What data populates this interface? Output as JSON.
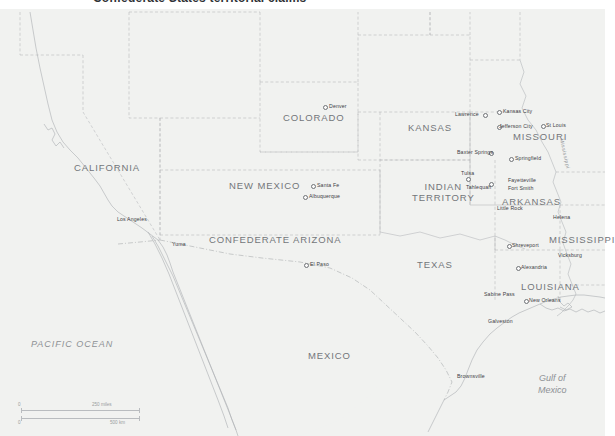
{
  "page": {
    "title_fragment": "Confederate States territorial claims",
    "background_color": "#ffffff",
    "land_color": "#f1f2f0",
    "water_color": "#fcfcfc",
    "border_color": "#b5b8bb",
    "label_color": "#73767a",
    "city_label_color": "#3d4044"
  },
  "water_labels": [
    {
      "name": "pacific-ocean",
      "text": "PACIFIC OCEAN"
    },
    {
      "name": "gulf-of-mexico",
      "line1": "Gulf of",
      "line2": "Mexico"
    }
  ],
  "river_labels": [
    {
      "name": "mississippi-river",
      "text": "Mississippi"
    }
  ],
  "regions": [
    {
      "name": "california",
      "label": "CALIFORNIA"
    },
    {
      "name": "colorado",
      "label": "COLORADO"
    },
    {
      "name": "kansas",
      "label": "KANSAS"
    },
    {
      "name": "missouri",
      "label": "MISSOURI"
    },
    {
      "name": "new-mexico",
      "label": "NEW MEXICO"
    },
    {
      "name": "confederate-arizona",
      "label": "CONFEDERATE ARIZONA"
    },
    {
      "name": "indian-territory",
      "label_line1": "INDIAN",
      "label_line2": "TERRITORY"
    },
    {
      "name": "arkansas",
      "label": "ARKANSAS"
    },
    {
      "name": "mississippi",
      "label": "MISSISSIPPI"
    },
    {
      "name": "louisiana",
      "label": "LOUISIANA"
    },
    {
      "name": "texas",
      "label": "TEXAS"
    },
    {
      "name": "mexico",
      "label": "MEXICO"
    }
  ],
  "cities": [
    {
      "name": "denver",
      "label": "Denver",
      "dot": true
    },
    {
      "name": "lawrence",
      "label": "Lawrence",
      "dot": true
    },
    {
      "name": "kansas-city",
      "label": "Kansas City",
      "dot": true
    },
    {
      "name": "jefferson-city",
      "label": "Jefferson City",
      "dot": true
    },
    {
      "name": "st-louis",
      "label": "St Louis",
      "dot": true
    },
    {
      "name": "baxter-springs",
      "label": "Baxter Springs",
      "dot": true
    },
    {
      "name": "springfield",
      "label": "Springfield",
      "dot": true
    },
    {
      "name": "tulsa",
      "label": "Tulsa",
      "dot": true
    },
    {
      "name": "tahlequah",
      "label": "Tahlequah",
      "dot": true
    },
    {
      "name": "fayetteville",
      "label": "Fayetteville",
      "dot": false
    },
    {
      "name": "fort-smith",
      "label": "Fort Smith",
      "dot": false
    },
    {
      "name": "little-rock",
      "label": "Little Rock",
      "dot": false
    },
    {
      "name": "helena",
      "label": "Helena",
      "dot": false
    },
    {
      "name": "vicksburg",
      "label": "Vicksburg",
      "dot": false
    },
    {
      "name": "shreveport",
      "label": "Shreveport",
      "dot": true
    },
    {
      "name": "alexandria",
      "label": "Alexandria",
      "dot": true
    },
    {
      "name": "new-orleans",
      "label": "New Orleans",
      "dot": true
    },
    {
      "name": "sabine-pass",
      "label": "Sabine Pass",
      "dot": false
    },
    {
      "name": "galveston",
      "label": "Galveston",
      "dot": false
    },
    {
      "name": "brownsville",
      "label": "Brownsville",
      "dot": false
    },
    {
      "name": "el-paso",
      "label": "El Paso",
      "dot": true
    },
    {
      "name": "yuma",
      "label": "Yuma",
      "dot": false
    },
    {
      "name": "los-angeles",
      "label": "Los Angeles",
      "dot": false
    },
    {
      "name": "santa-fe",
      "label": "Santa Fe",
      "dot": true
    },
    {
      "name": "albuquerque",
      "label": "Albuquerque",
      "dot": true
    }
  ],
  "scale_bar": {
    "name": "scale-bar",
    "miles_zero": "0",
    "miles_max": "250 miles",
    "km_zero": "0",
    "km_max": "500 km"
  }
}
